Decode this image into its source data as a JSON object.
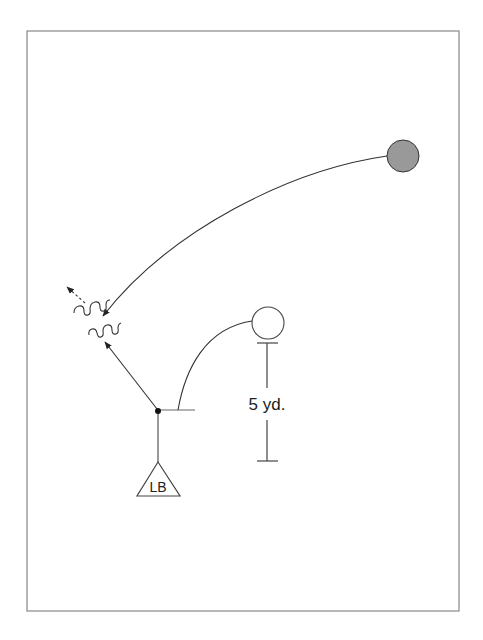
{
  "diagram": {
    "type": "football-play",
    "frame": {
      "x": 27,
      "y": 31,
      "width": 432,
      "height": 580,
      "stroke": "#888888"
    },
    "players": [
      {
        "id": "lb",
        "label": "LB",
        "shape": "triangle",
        "position": "linebacker"
      },
      {
        "id": "receiver",
        "label": "",
        "shape": "circle-open"
      },
      {
        "id": "ball-carrier",
        "label": "",
        "shape": "circle-filled",
        "fill": "#999999"
      }
    ],
    "distance_marker": {
      "label": "5 yd."
    },
    "colors": {
      "line": "#333333",
      "frame": "#888888",
      "filled_player": "#999999"
    }
  }
}
